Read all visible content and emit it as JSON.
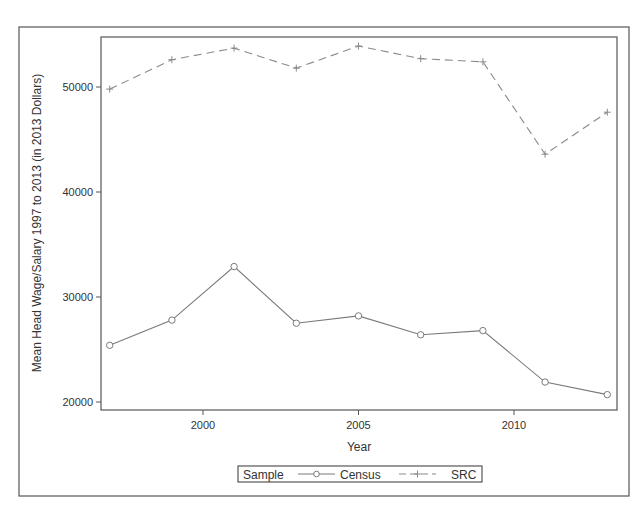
{
  "chart_data": {
    "type": "line",
    "title": "",
    "xlabel": "Year",
    "ylabel": "Mean Head Wage/Salary 1997 to 2013 (in 2013 Dollars)",
    "x": [
      1997,
      1999,
      2001,
      2003,
      2005,
      2007,
      2009,
      2011,
      2013
    ],
    "xticks": [
      2000,
      2005,
      2010
    ],
    "yticks": [
      20000,
      30000,
      40000,
      50000
    ],
    "xlim": [
      1997,
      2013
    ],
    "ylim": [
      19200,
      54900
    ],
    "grid": false,
    "legend_position": "bottom",
    "legend_title": "Sample",
    "series": [
      {
        "name": "Census",
        "marker": "circle",
        "line_style": "solid",
        "values": [
          25400,
          27800,
          32900,
          27500,
          28200,
          26400,
          26800,
          21900,
          20700
        ]
      },
      {
        "name": "SRC",
        "marker": "plus",
        "line_style": "dashed",
        "values": [
          49800,
          52600,
          53700,
          51800,
          53900,
          52700,
          52400,
          43600,
          47600
        ]
      }
    ]
  },
  "axis": {
    "x_title": "Year",
    "y_title": "Mean Head Wage/Salary 1997 to 2013 (in 2013 Dollars)",
    "x_tick_labels": [
      "2000",
      "2005",
      "2010"
    ],
    "y_tick_labels": [
      "20000",
      "30000",
      "40000",
      "50000"
    ]
  },
  "legend": {
    "title": "Sample",
    "items": [
      {
        "label": "Census"
      },
      {
        "label": "SRC"
      }
    ]
  },
  "colors": {
    "census_line": "#7a7a7a",
    "src_line": "#8a8a8a",
    "frame": "#555555",
    "text": "#333333"
  }
}
